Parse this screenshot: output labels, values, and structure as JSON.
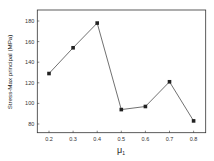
{
  "chart_data": {
    "type": "line",
    "title": "",
    "xlabel": "μ₁",
    "ylabel": "Stress-Max principal (MPa)",
    "x": [
      0.2,
      0.3,
      0.4,
      0.5,
      0.6,
      0.7,
      0.8
    ],
    "series": [
      {
        "name": "Stress-Max principal",
        "values": [
          129,
          154,
          178,
          94,
          97,
          121,
          83
        ],
        "marker": "square",
        "color": "#222222"
      }
    ],
    "xticks": [
      "0.2",
      "0.3",
      "0.4",
      "0.5",
      "0.6",
      "0.7",
      "0.8"
    ],
    "yticks": [
      "80",
      "100",
      "120",
      "140",
      "160",
      "180"
    ],
    "xlim": [
      0.15,
      0.85
    ],
    "ylim": [
      70,
      190
    ],
    "grid": false,
    "legend": null
  },
  "labels": {
    "xlabel_main": "μ",
    "xlabel_sub": "1",
    "ylabel": "Stress-Max principal (MPa)"
  }
}
